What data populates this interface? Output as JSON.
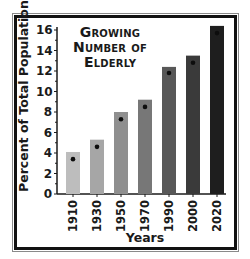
{
  "chart_data": {
    "type": "bar",
    "title": "Growing Number of Elderly",
    "title_lines": [
      "Growing",
      "Number of",
      "Elderly"
    ],
    "xlabel": "Years",
    "ylabel": "Percent of Total Population",
    "categories": [
      "1910",
      "1930",
      "1950",
      "1970",
      "1990",
      "2000",
      "2020"
    ],
    "series": [
      {
        "name": "bar",
        "values": [
          4.1,
          5.3,
          8.0,
          9.2,
          12.4,
          13.5,
          16.4
        ]
      },
      {
        "name": "dot marker",
        "values": [
          3.4,
          4.6,
          7.3,
          8.5,
          11.8,
          12.8,
          15.7
        ]
      }
    ],
    "ylim": [
      0,
      16
    ],
    "yticks": [
      0,
      2,
      4,
      6,
      8,
      10,
      12,
      14,
      16
    ],
    "grid": false,
    "legend": "none",
    "bar_colors": [
      "#bdbdbd",
      "#a6a6a6",
      "#8f8f8f",
      "#777777",
      "#585858",
      "#3a3a3a",
      "#1e1e1e"
    ]
  }
}
